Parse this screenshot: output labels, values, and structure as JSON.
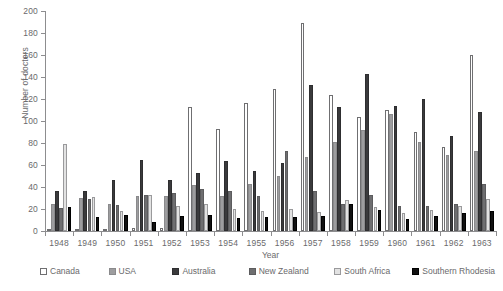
{
  "chart_data": {
    "type": "bar",
    "title": "",
    "xlabel": "Year",
    "ylabel": "Number of doctors",
    "ylim": [
      0,
      200
    ],
    "yticks": [
      0,
      20,
      40,
      60,
      80,
      100,
      120,
      140,
      160,
      180,
      200
    ],
    "grid": false,
    "legend_position": "bottom",
    "categories": [
      "1948",
      "1949",
      "1950",
      "1951",
      "1952",
      "1953",
      "1954",
      "1955",
      "1956",
      "1957",
      "1958",
      "1959",
      "1960",
      "1961",
      "1962",
      "1963"
    ],
    "series": [
      {
        "name": "Canada",
        "color": "#ffffff",
        "values": [
          2,
          2,
          2,
          3,
          3,
          113,
          93,
          116,
          129,
          189,
          124,
          104,
          110,
          90,
          76,
          160
        ]
      },
      {
        "name": "USA",
        "color": "#9d9d9f",
        "values": [
          25,
          30,
          25,
          32,
          32,
          42,
          32,
          43,
          50,
          67,
          81,
          92,
          106,
          81,
          69,
          73
        ]
      },
      {
        "name": "Australia",
        "color": "#3a3a3c",
        "values": [
          36,
          36,
          46,
          65,
          46,
          53,
          64,
          55,
          62,
          133,
          113,
          143,
          114,
          120,
          86,
          108
        ]
      },
      {
        "name": "New Zealand",
        "color": "#6e6e70",
        "values": [
          21,
          29,
          24,
          33,
          35,
          38,
          36,
          32,
          73,
          36,
          25,
          33,
          23,
          23,
          25,
          43
        ]
      },
      {
        "name": "South Africa",
        "color": "#e2e2e2",
        "values": [
          79,
          31,
          18,
          33,
          23,
          25,
          20,
          18,
          20,
          17,
          28,
          22,
          16,
          19,
          23,
          29
        ]
      },
      {
        "name": "Southern Rhodesia",
        "color": "#111111",
        "values": [
          22,
          13,
          15,
          8,
          14,
          15,
          12,
          13,
          13,
          14,
          25,
          19,
          11,
          14,
          16,
          18
        ]
      }
    ]
  },
  "legend": {
    "items": [
      {
        "label": "Canada"
      },
      {
        "label": "USA"
      },
      {
        "label": "Australia"
      },
      {
        "label": "New Zealand"
      },
      {
        "label": "South Africa"
      },
      {
        "label": "Southern Rhodesia"
      }
    ]
  }
}
